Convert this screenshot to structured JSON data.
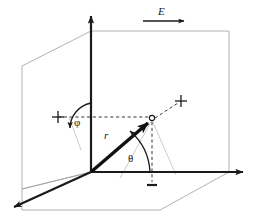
{
  "figure": {
    "type": "3d-coordinate-diagram",
    "labels": {
      "field_label": "E",
      "radius_label": "r",
      "polar_angle_label": "θ",
      "azimuth_angle_label": "φ"
    },
    "colors": {
      "axis": "#1a1a1a",
      "vector": "#111111",
      "plane_outline": "#9a9a9a",
      "dashed": "#222222",
      "background": "#ffffff"
    },
    "elements": {
      "z_axis": "vertical axis with upward arrowhead",
      "x_axis": "horizontal axis to the right with arrowhead",
      "y_axis": "oblique axis to lower-left with arrowhead",
      "position_vector": "bold arrow from origin to point P",
      "point_marker": "open circle at vector tip",
      "cross_marker_left": "+",
      "cross_marker_right": "+",
      "bottom_tick": "short dash below floor projection",
      "field_arrow": "horizontal arrow under E label"
    }
  }
}
